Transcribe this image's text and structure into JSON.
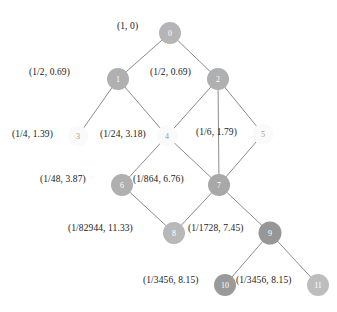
{
  "figure": {
    "type": "diagram",
    "kind": "directed-acyclic-graph"
  },
  "chart_data": {
    "type": "diagram",
    "title": "",
    "nodes": [
      {
        "id": "0",
        "label": "(1, 0)",
        "probability": "1",
        "value": "0",
        "cx": 170,
        "cy": 33,
        "r": 11,
        "fill": "#b5b5b5",
        "label_x": 117,
        "label_y": 22,
        "label_align": "right"
      },
      {
        "id": "1",
        "label": "(1/2, 0.69)",
        "probability": "1/2",
        "value": "0.69",
        "cx": 118,
        "cy": 79,
        "r": 11,
        "fill": "#b0b0b0",
        "label_x": 29,
        "label_y": 68,
        "label_align": "right"
      },
      {
        "id": "2",
        "label": "(1/2, 0.69)",
        "probability": "1/2",
        "value": "0.69",
        "cx": 218,
        "cy": 79,
        "r": 11,
        "fill": "#b0b0b0",
        "label_x": 150,
        "label_y": 68,
        "label_align": "right"
      },
      {
        "id": "3",
        "label": "(1/4, 1.39)",
        "probability": "1/4",
        "value": "1.39",
        "cx": 78,
        "cy": 136,
        "r": 10.5,
        "fill": "#fafafa",
        "label_x": 12,
        "label_y": 130,
        "label_align": "right"
      },
      {
        "id": "4",
        "label": "(1/24, 3.18)",
        "probability": "1/24",
        "value": "3.18",
        "cx": 167,
        "cy": 136,
        "r": 10.5,
        "fill": "#fafafa",
        "label_x": 100,
        "label_y": 130,
        "label_align": "right"
      },
      {
        "id": "5",
        "label": "(1/6, 1.79)",
        "probability": "1/6",
        "value": "1.79",
        "cx": 263,
        "cy": 134,
        "r": 10.5,
        "fill": "#fafafa",
        "label_x": 196,
        "label_y": 128,
        "label_align": "right"
      },
      {
        "id": "6",
        "label": "(1/48, 3.87)",
        "probability": "1/48",
        "value": "3.87",
        "cx": 122,
        "cy": 185,
        "r": 11,
        "fill": "#b0b0b0",
        "label_x": 40,
        "label_y": 175,
        "label_align": "right"
      },
      {
        "id": "7",
        "label": "(1/864, 6.76)",
        "probability": "1/864",
        "value": "6.76",
        "cx": 219,
        "cy": 185,
        "r": 11,
        "fill": "#a8a8a8",
        "label_x": 133,
        "label_y": 175,
        "label_align": "right"
      },
      {
        "id": "8",
        "label": "(1/82944, 11.33)",
        "probability": "1/82944",
        "value": "11.33",
        "cx": 174,
        "cy": 233,
        "r": 11,
        "fill": "#b8b8b8",
        "label_x": 68,
        "label_y": 224,
        "label_align": "right"
      },
      {
        "id": "9",
        "label": "(1/1728, 7.45)",
        "probability": "1/1728",
        "value": "7.45",
        "cx": 270,
        "cy": 233,
        "r": 11.5,
        "fill": "#979797",
        "label_x": 188,
        "label_y": 224,
        "label_align": "right"
      },
      {
        "id": "10",
        "label": "(1/3456, 8.15)",
        "probability": "1/3456",
        "value": "8.15",
        "cx": 225,
        "cy": 285,
        "r": 11,
        "fill": "#9a9a9a",
        "label_x": 143,
        "label_y": 276,
        "label_align": "right"
      },
      {
        "id": "11",
        "label": "(1/3456, 8.15)",
        "probability": "1/3456",
        "value": "8.15",
        "cx": 318,
        "cy": 285,
        "r": 11,
        "fill": "#bdbdbd",
        "label_x": 236,
        "label_y": 276,
        "label_align": "right"
      }
    ],
    "edges": [
      {
        "from": "0",
        "to": "1"
      },
      {
        "from": "0",
        "to": "2"
      },
      {
        "from": "1",
        "to": "3"
      },
      {
        "from": "1",
        "to": "4"
      },
      {
        "from": "2",
        "to": "4"
      },
      {
        "from": "2",
        "to": "7"
      },
      {
        "from": "2",
        "to": "5"
      },
      {
        "from": "4",
        "to": "6"
      },
      {
        "from": "4",
        "to": "7"
      },
      {
        "from": "5",
        "to": "7"
      },
      {
        "from": "6",
        "to": "8"
      },
      {
        "from": "7",
        "to": "8"
      },
      {
        "from": "7",
        "to": "9"
      },
      {
        "from": "9",
        "to": "10"
      },
      {
        "from": "9",
        "to": "11"
      }
    ],
    "edge_color": "#8c8c8c",
    "background": "#ffffff",
    "label_color": "#1a1a1a"
  }
}
